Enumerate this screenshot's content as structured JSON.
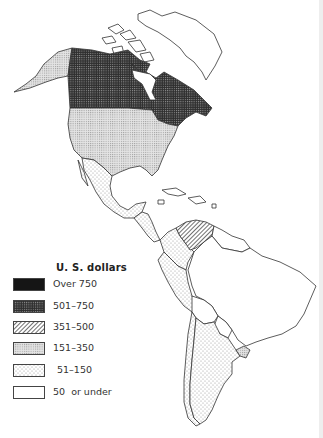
{
  "map": {
    "title": "U. S. dollars",
    "region": "The Americas",
    "regions": [
      {
        "name": "Canada",
        "category": "501-750"
      },
      {
        "name": "United States",
        "category": "151-350"
      },
      {
        "name": "Alaska",
        "category": "151-350"
      },
      {
        "name": "Mexico",
        "category": "51-150"
      },
      {
        "name": "Central America",
        "category": "51-150"
      },
      {
        "name": "Venezuela",
        "category": "351-500"
      },
      {
        "name": "Colombia",
        "category": "51-150"
      },
      {
        "name": "Peru",
        "category": "51-150"
      },
      {
        "name": "Argentina",
        "category": "51-150"
      },
      {
        "name": "Uruguay",
        "category": "151-350"
      },
      {
        "name": "Chile",
        "category": "51-150"
      },
      {
        "name": "Brazil",
        "category": "50 or under"
      },
      {
        "name": "Greenland",
        "category": "50 or under"
      }
    ]
  },
  "legend": {
    "title": "U. S. dollars",
    "items": [
      {
        "label": "Over 750",
        "pattern": "solid-black",
        "color": "#1a1a1a"
      },
      {
        "label": "501–750",
        "pattern": "dense-grid",
        "color": "#3a3a3a"
      },
      {
        "label": "351–500",
        "pattern": "diagonal-hatch",
        "color": "#777777"
      },
      {
        "label": "151–350",
        "pattern": "light-grid",
        "color": "#cfcfcf"
      },
      {
        "label": "51–150",
        "pattern": "sparse-dots",
        "color": "#e8e8e8"
      },
      {
        "label": "50  or under",
        "pattern": "blank",
        "color": "#ffffff"
      }
    ]
  },
  "colors": {
    "outline": "#333333",
    "background": "#ffffff"
  }
}
